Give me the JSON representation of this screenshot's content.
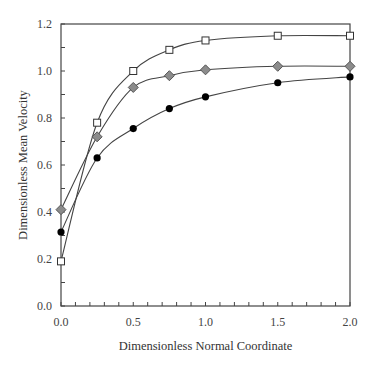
{
  "chart_data": {
    "type": "line",
    "title": "",
    "xlabel": "Dimensionless Normal Coordinate",
    "ylabel": "Dimensionless Mean Velocity",
    "xlim": [
      0.0,
      2.0
    ],
    "ylim": [
      0.0,
      1.2
    ],
    "x_ticks": [
      "0.0",
      "0.5",
      "1.0",
      "1.5",
      "2.0"
    ],
    "y_ticks": [
      "0.0",
      "0.2",
      "0.4",
      "0.6",
      "0.8",
      "1.0",
      "1.2"
    ],
    "x_minor_step": 0.1,
    "y_minor_step": 0.1,
    "grid": false,
    "legend": null,
    "x": [
      0.0,
      0.25,
      0.5,
      0.75,
      1.0,
      1.5,
      2.0
    ],
    "series": [
      {
        "name": "open-square",
        "marker": "square",
        "fill": "#ffffff",
        "values": [
          0.19,
          0.78,
          1.0,
          1.09,
          1.13,
          1.15,
          1.15
        ]
      },
      {
        "name": "gray-diamond",
        "marker": "diamond",
        "fill": "#8c8c8c",
        "values": [
          0.41,
          0.72,
          0.93,
          0.98,
          1.005,
          1.02,
          1.02
        ]
      },
      {
        "name": "filled-circle",
        "marker": "circle",
        "fill": "#000000",
        "values": [
          0.315,
          0.63,
          0.755,
          0.84,
          0.89,
          0.95,
          0.975
        ]
      }
    ]
  }
}
